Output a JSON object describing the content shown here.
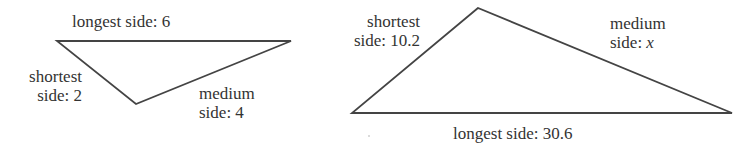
{
  "figure": {
    "stroke_color": "#444444",
    "text_color": "#333333",
    "background": "#ffffff"
  },
  "triangles": [
    {
      "id": "small",
      "vertices": [
        [
          57,
          41
        ],
        [
          291,
          41
        ],
        [
          136,
          104
        ]
      ],
      "labels": {
        "longest": {
          "line1": "longest side: 6"
        },
        "shortest": {
          "line1": "shortest",
          "line2": "side: 2"
        },
        "medium": {
          "line1": "medium",
          "line2": "side: 4"
        }
      },
      "sides": {
        "shortest": 2,
        "medium": 4,
        "longest": 6
      }
    },
    {
      "id": "large",
      "vertices": [
        [
          478,
          8
        ],
        [
          352,
          113
        ],
        [
          732,
          113
        ]
      ],
      "labels": {
        "shortest": {
          "line1": "shortest",
          "line2": "side: 10.2"
        },
        "medium": {
          "line1": "medium",
          "line2_prefix": "side: ",
          "line2_var": "x"
        },
        "longest": {
          "line1": "longest side: 30.6"
        }
      },
      "sides": {
        "shortest": 10.2,
        "medium": "x",
        "longest": 30.6
      }
    }
  ]
}
